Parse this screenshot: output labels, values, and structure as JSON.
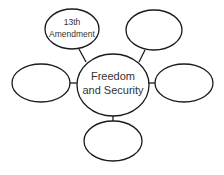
{
  "diagram": {
    "type": "concept-web",
    "center": {
      "line1": "Freedom",
      "line2": "and Security"
    },
    "nodes": [
      {
        "position": "top-left",
        "line1": "13th",
        "line2": "Amendment"
      },
      {
        "position": "top-right",
        "line1": "",
        "line2": ""
      },
      {
        "position": "left",
        "line1": "",
        "line2": ""
      },
      {
        "position": "right",
        "line1": "",
        "line2": ""
      },
      {
        "position": "bottom",
        "line1": "",
        "line2": ""
      }
    ],
    "colors": {
      "stroke": "#1a1a1a",
      "fill": "#ffffff",
      "text": "#333333"
    }
  }
}
